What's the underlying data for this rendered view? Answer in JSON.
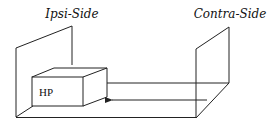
{
  "labels": {
    "ipsi": "Ipsi-Side",
    "contra": "Contra-Side",
    "box": "HP"
  },
  "elements": {
    "left_panel": "ipsi-side-wall",
    "right_panel": "contra-side-wall",
    "box": "hp-box",
    "arrow": "arrow-contra-to-ipsi"
  },
  "colors": {
    "stroke": "#222222",
    "background": "#ffffff"
  }
}
